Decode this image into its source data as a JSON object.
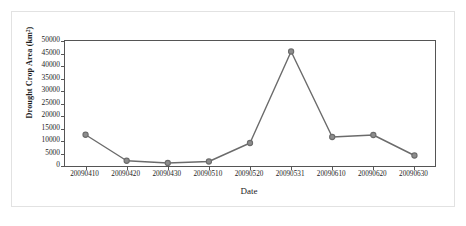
{
  "chart_data": {
    "type": "line",
    "title": "",
    "xlabel": "Date",
    "ylabel": "Drought Crop Area (km²)",
    "categories": [
      "20090410",
      "20090420",
      "20090430",
      "20090510",
      "20090520",
      "20090531",
      "20090610",
      "20090620",
      "20090630"
    ],
    "values": [
      12500,
      2100,
      1200,
      1800,
      9200,
      45800,
      11600,
      12400,
      4200
    ],
    "series": [
      {
        "name": "Drought Crop Area",
        "values": [
          12500,
          2100,
          1200,
          1800,
          9200,
          45800,
          11600,
          12400,
          4200
        ]
      }
    ],
    "ylim": [
      0,
      50000
    ],
    "ytick_values": [
      0,
      5000,
      10000,
      15000,
      20000,
      25000,
      30000,
      35000,
      40000,
      45000,
      50000
    ],
    "ytick_labels": [
      "0",
      "5000",
      "10000",
      "15000",
      "20000",
      "25000",
      "30000",
      "35000",
      "40000",
      "45000",
      "50000"
    ],
    "grid": false,
    "legend": "none",
    "marker": "circle",
    "line_color": "#6b6b6b",
    "marker_color": "#6b6b6b",
    "axis_color": "#555555",
    "background_color": "#ffffff"
  }
}
